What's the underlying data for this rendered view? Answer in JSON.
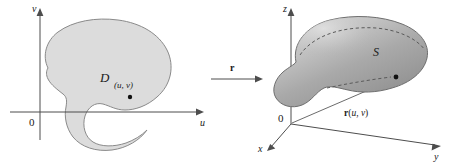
{
  "figure": {
    "colors": {
      "region_fill": "#dcdcdc",
      "region_stroke": "#8a8a8a",
      "surface_light": "#d2d2d2",
      "surface_mid": "#ababab",
      "surface_dark": "#8f8f8f",
      "surface_stroke": "#6e6e6e",
      "axis": "#4d4d4d",
      "text": "#1a1a1a",
      "dot": "#111111",
      "background": "#ffffff"
    }
  },
  "left_panel": {
    "name": "uv-plane",
    "axes": {
      "vertical_label": "v",
      "horizontal_label": "u",
      "origin_label": "0"
    },
    "region_label": "D",
    "point_label": "(u, v)",
    "point_label_parts": {
      "open": "(",
      "u": "u",
      "comma": ", ",
      "v": "v",
      "close": ")"
    }
  },
  "mapping_arrow": {
    "name": "r-map-arrow",
    "label": "r",
    "direction": "left-to-right"
  },
  "right_panel": {
    "name": "xyz-space",
    "axes": {
      "z_label": "z",
      "y_label": "y",
      "x_label": "x",
      "origin_label": "0"
    },
    "surface_label": "S",
    "vector_label": "r(u, v)",
    "vector_label_parts": {
      "r": "r",
      "open": "(",
      "u": "u",
      "comma": ", ",
      "v": "v",
      "close": ")"
    }
  }
}
